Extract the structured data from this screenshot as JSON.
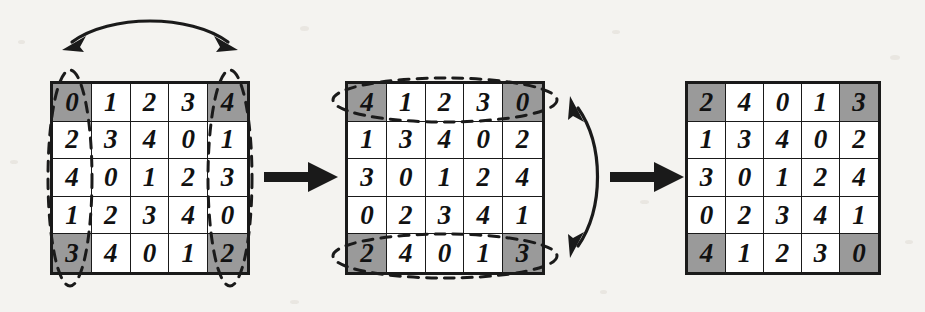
{
  "figure": {
    "background_color": "#f4f3f0",
    "ink_color": "#1a1a1a",
    "shaded_cell_color": "#9a9a9a",
    "cell_background": "#ffffff"
  },
  "matrices": [
    {
      "id": "left",
      "name": "original-matrix",
      "rows": 5,
      "cols": 5,
      "values": [
        [
          0,
          1,
          2,
          3,
          4
        ],
        [
          2,
          3,
          4,
          0,
          1
        ],
        [
          4,
          0,
          1,
          2,
          3
        ],
        [
          1,
          2,
          3,
          4,
          0
        ],
        [
          3,
          4,
          0,
          1,
          2
        ]
      ],
      "shaded_cells": [
        [
          0,
          0
        ],
        [
          0,
          4
        ],
        [
          4,
          0
        ],
        [
          4,
          4
        ]
      ],
      "highlight": {
        "type": "column-ellipses",
        "columns": [
          0,
          4
        ],
        "style": "dashed"
      },
      "swap_arrow": {
        "type": "double-headed-curved",
        "orientation": "horizontal",
        "position": "above",
        "label": ""
      }
    },
    {
      "id": "middle",
      "name": "column-swapped-matrix",
      "rows": 5,
      "cols": 5,
      "values": [
        [
          4,
          1,
          2,
          3,
          0
        ],
        [
          1,
          3,
          4,
          0,
          2
        ],
        [
          3,
          0,
          1,
          2,
          4
        ],
        [
          0,
          2,
          3,
          4,
          1
        ],
        [
          2,
          4,
          0,
          1,
          3
        ]
      ],
      "shaded_cells": [
        [
          0,
          0
        ],
        [
          0,
          4
        ],
        [
          4,
          0
        ],
        [
          4,
          4
        ]
      ],
      "highlight": {
        "type": "row-ellipses",
        "rows": [
          0,
          4
        ],
        "style": "dashed"
      },
      "swap_arrow": {
        "type": "double-headed-curved",
        "orientation": "vertical",
        "position": "right",
        "label": ""
      }
    },
    {
      "id": "right",
      "name": "row-swapped-matrix",
      "rows": 5,
      "cols": 5,
      "values": [
        [
          2,
          4,
          0,
          1,
          3
        ],
        [
          1,
          3,
          4,
          0,
          2
        ],
        [
          3,
          0,
          1,
          2,
          4
        ],
        [
          0,
          2,
          3,
          4,
          1
        ],
        [
          4,
          1,
          2,
          3,
          0
        ]
      ],
      "shaded_cells": [
        [
          0,
          0
        ],
        [
          0,
          4
        ],
        [
          4,
          0
        ],
        [
          4,
          4
        ]
      ],
      "highlight": null,
      "swap_arrow": null
    }
  ],
  "transition_arrows": [
    {
      "name": "arrow-left-to-middle",
      "from": "left",
      "to": "middle",
      "style": "solid-block",
      "label": ""
    },
    {
      "name": "arrow-middle-to-right",
      "from": "middle",
      "to": "right",
      "style": "solid-block",
      "label": ""
    }
  ]
}
